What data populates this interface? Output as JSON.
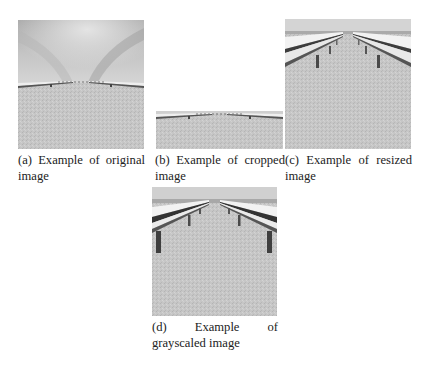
{
  "figure": {
    "subfigures": [
      {
        "id": "a",
        "label": "(a)",
        "caption": "(a) Example of original image",
        "caption_line1": "(a) Example of original",
        "caption_line2": "image",
        "image_description": "original road scene with sky and guardrails"
      },
      {
        "id": "b",
        "label": "(b)",
        "caption": "(b) Example of cropped image",
        "caption_line1": "(b) Example of cropped",
        "caption_line2": "image",
        "image_description": "cropped road scene (bottom part, sky removed)"
      },
      {
        "id": "c",
        "label": "(c)",
        "caption": "(c) Example of resized image",
        "caption_line1": "(c) Example of resized",
        "caption_line2": "image",
        "image_description": "resized road scene with guardrails filling frame"
      },
      {
        "id": "d",
        "label": "(d)",
        "caption": "(d) Example of grayscaled image",
        "caption_line1_parts": [
          "(d)",
          "Example",
          "of"
        ],
        "caption_line2": "grayscaled image",
        "image_description": "grayscaled road scene with guardrails"
      }
    ]
  }
}
